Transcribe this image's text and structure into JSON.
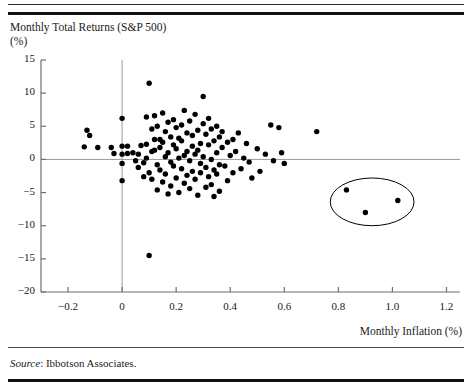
{
  "figure": {
    "y_axis_title": "Monthly Total Returns (S&P 500)\n(%)",
    "x_axis_title": "Monthly Inflation (%)",
    "source_label": "Source",
    "source_text": ": Ibbotson Associates."
  },
  "colors": {
    "point": "#000000",
    "axis": "#6e6e6e",
    "zero_line": "#9a9a9a",
    "ellipse": "#000000",
    "rule": "#111111",
    "text": "#1a1a1a"
  },
  "chart_data": {
    "type": "scatter",
    "title": "Monthly Total Returns (S&P 500) (%)",
    "xlabel": "Monthly Inflation (%)",
    "ylabel": "Monthly Total Returns (S&P 500) (%)",
    "xlim": [
      -0.3,
      1.25
    ],
    "ylim": [
      -20,
      15
    ],
    "xticks": [
      -0.2,
      0,
      0.2,
      0.4,
      0.6,
      0.8,
      1.0,
      1.2
    ],
    "xtick_labels": [
      "−0.2",
      "0",
      "0.2",
      "0.4",
      "0.6",
      "0.8",
      "1.0",
      "1.2"
    ],
    "yticks": [
      15,
      10,
      5,
      0,
      -5,
      -10,
      -15,
      -20
    ],
    "ytick_labels": [
      "15",
      "10",
      "5",
      "0",
      "−5",
      "−10",
      "−15",
      "−20"
    ],
    "grid": false,
    "legend": null,
    "zero_reference_lines": {
      "horizontal_y": 0,
      "vertical_x": 0
    },
    "annotations": [
      {
        "type": "ellipse",
        "label": "outlier-highlight-ellipse",
        "center_x": 0.925,
        "center_y": -6.4,
        "radius_x": 0.155,
        "radius_y": 3.6
      }
    ],
    "series": [
      {
        "name": "Monthly observations",
        "marker": "circle",
        "color": "#000000",
        "points": [
          [
            -0.14,
            1.9
          ],
          [
            -0.13,
            4.4
          ],
          [
            -0.12,
            3.6
          ],
          [
            -0.09,
            1.8
          ],
          [
            -0.04,
            1.8
          ],
          [
            -0.03,
            0.9
          ],
          [
            0.0,
            6.2
          ],
          [
            0.0,
            2.0
          ],
          [
            0.0,
            0.8
          ],
          [
            0.0,
            -0.6
          ],
          [
            0.0,
            -3.2
          ],
          [
            0.02,
            2.0
          ],
          [
            0.02,
            0.9
          ],
          [
            0.04,
            1.0
          ],
          [
            0.05,
            -0.2
          ],
          [
            0.06,
            0.8
          ],
          [
            0.06,
            -1.2
          ],
          [
            0.07,
            2.1
          ],
          [
            0.08,
            -0.5
          ],
          [
            0.08,
            -2.6
          ],
          [
            0.09,
            6.4
          ],
          [
            0.09,
            2.3
          ],
          [
            0.09,
            0.2
          ],
          [
            0.1,
            11.5
          ],
          [
            0.1,
            -14.5
          ],
          [
            0.1,
            -2.0
          ],
          [
            0.11,
            4.6
          ],
          [
            0.11,
            1.2
          ],
          [
            0.11,
            -3.0
          ],
          [
            0.12,
            6.6
          ],
          [
            0.12,
            3.0
          ],
          [
            0.12,
            1.4
          ],
          [
            0.13,
            5.0
          ],
          [
            0.13,
            -0.8
          ],
          [
            0.13,
            -4.6
          ],
          [
            0.14,
            3.0
          ],
          [
            0.14,
            1.8
          ],
          [
            0.14,
            -1.6
          ],
          [
            0.15,
            7.0
          ],
          [
            0.15,
            2.6
          ],
          [
            0.15,
            -3.4
          ],
          [
            0.16,
            4.2
          ],
          [
            0.16,
            0.4
          ],
          [
            0.16,
            -2.2
          ],
          [
            0.17,
            5.6
          ],
          [
            0.17,
            1.0
          ],
          [
            0.17,
            -5.2
          ],
          [
            0.18,
            3.4
          ],
          [
            0.18,
            -0.4
          ],
          [
            0.18,
            -4.0
          ],
          [
            0.19,
            6.0
          ],
          [
            0.19,
            2.2
          ],
          [
            0.19,
            -1.0
          ],
          [
            0.2,
            4.8
          ],
          [
            0.2,
            1.6
          ],
          [
            0.2,
            -2.8
          ],
          [
            0.21,
            3.2
          ],
          [
            0.21,
            0.2
          ],
          [
            0.21,
            -5.0
          ],
          [
            0.22,
            5.2
          ],
          [
            0.22,
            2.8
          ],
          [
            0.22,
            -1.4
          ],
          [
            0.23,
            7.4
          ],
          [
            0.23,
            0.6
          ],
          [
            0.23,
            -3.6
          ],
          [
            0.24,
            4.0
          ],
          [
            0.24,
            1.2
          ],
          [
            0.24,
            -2.4
          ],
          [
            0.25,
            5.8
          ],
          [
            0.25,
            -0.2
          ],
          [
            0.25,
            -4.4
          ],
          [
            0.26,
            3.6
          ],
          [
            0.26,
            2.0
          ],
          [
            0.26,
            -1.8
          ],
          [
            0.27,
            6.8
          ],
          [
            0.27,
            0.8
          ],
          [
            0.27,
            -3.0
          ],
          [
            0.28,
            4.4
          ],
          [
            0.28,
            1.4
          ],
          [
            0.28,
            -5.4
          ],
          [
            0.29,
            2.4
          ],
          [
            0.29,
            -0.6
          ],
          [
            0.29,
            -2.0
          ],
          [
            0.3,
            9.5
          ],
          [
            0.3,
            5.4
          ],
          [
            0.3,
            0.4
          ],
          [
            0.31,
            3.8
          ],
          [
            0.31,
            -1.2
          ],
          [
            0.31,
            -4.2
          ],
          [
            0.32,
            6.2
          ],
          [
            0.32,
            2.2
          ],
          [
            0.32,
            -2.6
          ],
          [
            0.33,
            4.6
          ],
          [
            0.33,
            0.0
          ],
          [
            0.33,
            -3.8
          ],
          [
            0.34,
            2.8
          ],
          [
            0.34,
            -1.6
          ],
          [
            0.34,
            -5.6
          ],
          [
            0.35,
            5.0
          ],
          [
            0.35,
            1.0
          ],
          [
            0.35,
            -2.2
          ],
          [
            0.36,
            3.4
          ],
          [
            0.36,
            -0.8
          ],
          [
            0.36,
            -4.8
          ],
          [
            0.37,
            4.2
          ],
          [
            0.37,
            1.8
          ],
          [
            0.38,
            -1.0
          ],
          [
            0.39,
            2.6
          ],
          [
            0.39,
            -3.2
          ],
          [
            0.4,
            0.6
          ],
          [
            0.41,
            3.0
          ],
          [
            0.41,
            -2.0
          ],
          [
            0.42,
            1.2
          ],
          [
            0.43,
            4.0
          ],
          [
            0.44,
            -1.4
          ],
          [
            0.45,
            0.2
          ],
          [
            0.46,
            2.4
          ],
          [
            0.47,
            -0.4
          ],
          [
            0.48,
            -2.8
          ],
          [
            0.5,
            1.6
          ],
          [
            0.51,
            -1.8
          ],
          [
            0.53,
            0.8
          ],
          [
            0.55,
            5.2
          ],
          [
            0.56,
            -0.2
          ],
          [
            0.58,
            4.8
          ],
          [
            0.59,
            1.0
          ],
          [
            0.6,
            -0.6
          ],
          [
            0.72,
            4.2
          ],
          [
            0.83,
            -4.6
          ],
          [
            0.9,
            -8.0
          ],
          [
            1.02,
            -6.2
          ]
        ]
      }
    ]
  }
}
